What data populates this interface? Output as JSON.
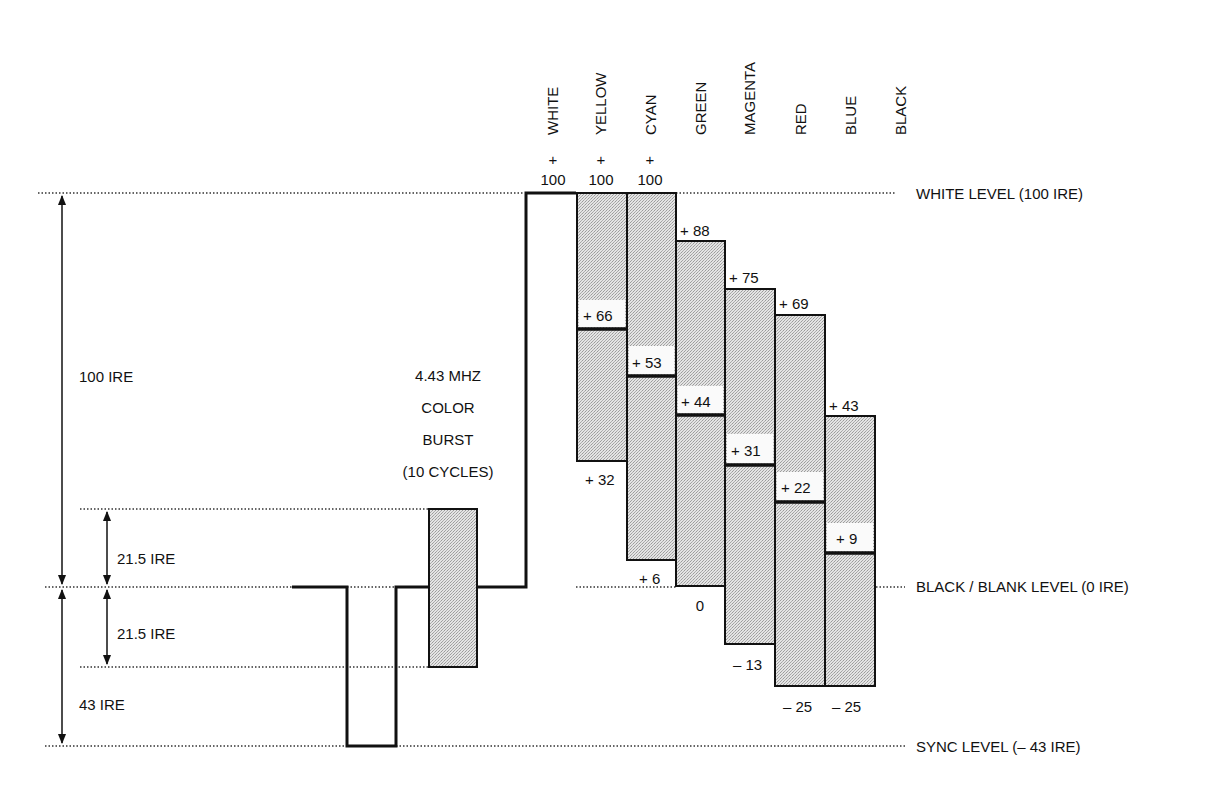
{
  "diagram": {
    "level_labels": {
      "white": "WHITE LEVEL (100 IRE)",
      "black": "BLACK / BLANK LEVEL (0 IRE)",
      "sync": "SYNC LEVEL (– 43 IRE)"
    },
    "dimension_labels": {
      "total": "100 IRE",
      "burst_upper": "21.5 IRE",
      "burst_lower": "21.5 IRE",
      "sync": "43 IRE"
    },
    "burst_text": {
      "line1": "4.43 MHZ",
      "line2": "COLOR",
      "line3": "BURST",
      "line4": "(10 CYCLES)"
    },
    "bars": [
      {
        "name": "WHITE",
        "top_label_plus": "+",
        "top_label": "100",
        "top": 100,
        "mid": null,
        "bottom": null,
        "mid_label": "",
        "bottom_label": ""
      },
      {
        "name": "YELLOW",
        "top_label_plus": "+",
        "top_label": "100",
        "top": 100,
        "mid": 66,
        "bottom": 32,
        "mid_label": "+ 66",
        "bottom_label": "+ 32"
      },
      {
        "name": "CYAN",
        "top_label_plus": "+",
        "top_label": "100",
        "top": 100,
        "mid": 53,
        "bottom": 6,
        "mid_label": "+ 53",
        "bottom_label": "+ 6"
      },
      {
        "name": "GREEN",
        "top_label_plus": "",
        "top_label": "+ 88",
        "top": 88,
        "mid": 44,
        "bottom": 0,
        "mid_label": "+ 44",
        "bottom_label": "0"
      },
      {
        "name": "MAGENTA",
        "top_label_plus": "",
        "top_label": "+ 75",
        "top": 75,
        "mid": 31,
        "bottom": -13,
        "mid_label": "+ 31",
        "bottom_label": "– 13"
      },
      {
        "name": "RED",
        "top_label_plus": "",
        "top_label": "+ 69",
        "top": 69,
        "mid": 22,
        "bottom": -25,
        "mid_label": "+ 22",
        "bottom_label": "– 25"
      },
      {
        "name": "BLUE",
        "top_label_plus": "",
        "top_label": "+ 43",
        "top": 43,
        "mid": 9,
        "bottom": -25,
        "mid_label": "+ 9",
        "bottom_label": "– 25"
      },
      {
        "name": "BLACK",
        "top_label_plus": "",
        "top_label": "",
        "top": 0,
        "mid": null,
        "bottom": null,
        "mid_label": "",
        "bottom_label": ""
      }
    ],
    "colors": {
      "ink": "#111111",
      "bar_fill": "#d4d4d4",
      "background": "#ffffff"
    }
  }
}
